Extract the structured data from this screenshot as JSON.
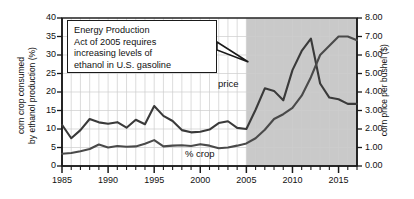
{
  "chart_data": {
    "type": "line",
    "title": "",
    "xlabel": "",
    "ylabel": "corn crop consumed by ethanol production (%)",
    "ylabel_right": "corn price per bushel ($)",
    "xlim": [
      1985,
      2017
    ],
    "ylim": [
      0,
      40
    ],
    "ylim_right": [
      0.0,
      8.0
    ],
    "yticks": [
      0,
      5,
      10,
      15,
      20,
      25,
      30,
      35,
      40
    ],
    "yticks_right": [
      "0.00",
      "1.00",
      "2.00",
      "3.00",
      "4.00",
      "5.00",
      "6.00",
      "7.00",
      "8.00"
    ],
    "xticks": [
      1985,
      1990,
      1995,
      2000,
      2005,
      2010,
      2015
    ],
    "grid": true,
    "legend": "inline-labels",
    "shaded_region": {
      "from": 2005,
      "to": 2017,
      "color": "#c9c9c9",
      "label": "post Energy Policy Act period"
    },
    "x": [
      1985,
      1986,
      1987,
      1988,
      1989,
      1990,
      1991,
      1992,
      1993,
      1994,
      1995,
      1996,
      1997,
      1998,
      1999,
      2000,
      2001,
      2002,
      2003,
      2004,
      2005,
      2006,
      2007,
      2008,
      2009,
      2010,
      2011,
      2012,
      2013,
      2014,
      2015,
      2016,
      2017
    ],
    "series": [
      {
        "name": "price",
        "axis": "right",
        "units": "$ per bushel",
        "color": "#3a3a3a",
        "values": [
          2.23,
          1.5,
          1.94,
          2.54,
          2.36,
          2.28,
          2.37,
          2.07,
          2.5,
          2.26,
          3.24,
          2.71,
          2.43,
          1.94,
          1.82,
          1.85,
          1.97,
          2.32,
          2.42,
          2.06,
          2.0,
          3.04,
          4.2,
          4.06,
          3.55,
          5.18,
          6.22,
          6.89,
          4.46,
          3.7,
          3.61,
          3.36,
          3.36
        ]
      },
      {
        "name": "% crop",
        "axis": "left",
        "units": "percent of corn crop",
        "color": "#4a4a4a",
        "values": [
          3.3,
          3.5,
          4.0,
          4.6,
          5.8,
          5.0,
          5.4,
          5.2,
          5.3,
          6.0,
          7.0,
          5.3,
          5.5,
          5.6,
          5.4,
          5.9,
          5.5,
          4.8,
          5.0,
          5.5,
          6.1,
          7.5,
          9.8,
          12.7,
          14.0,
          15.7,
          19.0,
          24.0,
          30.0,
          32.5,
          35.0,
          35.0,
          34.0
        ]
      }
    ],
    "annotations": [
      {
        "name": "energy-policy-callout",
        "lines": [
          "Energy Production",
          "Act of 2005 requires",
          "increasing levels of",
          "ethanol in U.S. gasoline"
        ],
        "points_to_year": 2005
      }
    ]
  },
  "labels": {
    "y_left": "corn crop consumed by ethanol production (%)",
    "y_left_line1": "corn crop consumed",
    "y_left_line2": "by ethanol production (%)",
    "y_right": "corn price per bushel ($)",
    "series_price": "price",
    "series_crop": "% crop"
  },
  "colors": {
    "background": "#ffffff",
    "grid": "#cdcdcd",
    "axis": "#1a1a1a",
    "shade": "#c9c9c9",
    "price_line": "#3a3a3a",
    "crop_line": "#4a4a4a",
    "text": "#111111"
  }
}
